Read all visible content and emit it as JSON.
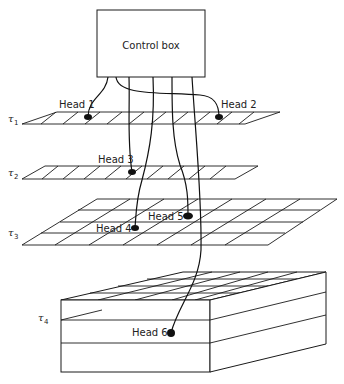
{
  "control_box": {
    "label": "Control box"
  },
  "planes": [
    {
      "symbol": "τ",
      "subscript": "1"
    },
    {
      "symbol": "τ",
      "subscript": "2"
    },
    {
      "symbol": "τ",
      "subscript": "3"
    },
    {
      "symbol": "τ",
      "subscript": "4"
    }
  ],
  "heads": [
    {
      "label": "Head 1",
      "plane": "τ1"
    },
    {
      "label": "Head 2",
      "plane": "τ1"
    },
    {
      "label": "Head 3",
      "plane": "τ2"
    },
    {
      "label": "Head 4",
      "plane": "τ3"
    },
    {
      "label": "Head 5",
      "plane": "τ3"
    },
    {
      "label": "Head 6",
      "plane": "τ4"
    }
  ],
  "colors": {
    "ink": "#111111",
    "background": "#ffffff"
  }
}
